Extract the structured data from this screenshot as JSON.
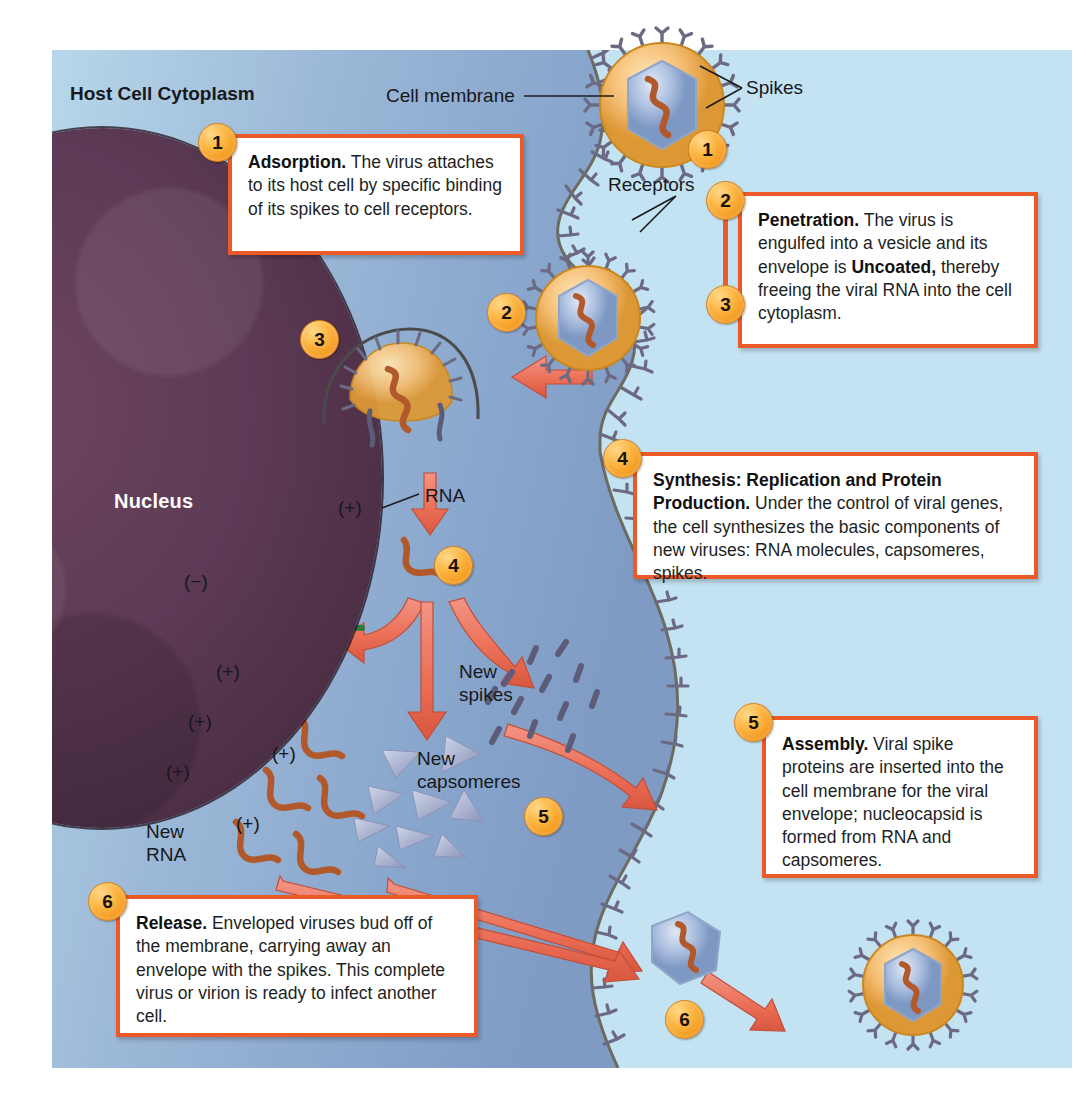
{
  "diagram": {
    "title_labels": {
      "cytoplasm": "Host Cell Cytoplasm",
      "nucleus": "Nucleus",
      "cell_membrane": "Cell membrane",
      "spikes": "Spikes",
      "receptors": "Receptors",
      "rna": "RNA",
      "new_spikes": "New\nspikes",
      "new_capsomeres": "New\ncapsomeres",
      "new_rna": "New\nRNA"
    },
    "polarity_markers": [
      {
        "id": "rna-plus-top",
        "text": "(+)"
      },
      {
        "id": "rna-minus",
        "text": "(−)"
      },
      {
        "id": "new-rna-plus-1",
        "text": "(+)"
      },
      {
        "id": "new-rna-plus-2",
        "text": "(+)"
      },
      {
        "id": "new-rna-plus-3",
        "text": "(+)"
      },
      {
        "id": "new-rna-plus-4",
        "text": "(+)"
      },
      {
        "id": "new-rna-plus-5",
        "text": "(+)"
      }
    ],
    "steps": [
      {
        "number": "1",
        "title": "Adsorption.",
        "body": " The virus attaches to its host cell by specific binding of its spikes to cell receptors."
      },
      {
        "number": "2",
        "title": "Penetration.",
        "body": " The virus is engulfed into a vesicle and its envelope is"
      },
      {
        "number": "3",
        "title": "Uncoated,",
        "body": " thereby freeing the viral RNA into the cell cytoplasm."
      },
      {
        "number": "4",
        "title": "Synthesis: Replication and Protein Production.",
        "body": " Under the control of viral genes, the cell synthesizes the basic components of new viruses: RNA molecules, capsomeres, spikes."
      },
      {
        "number": "5",
        "title": "Assembly.",
        "body": " Viral spike proteins are inserted into the cell membrane for the viral envelope; nucleocapsid is formed from RNA and capsomeres."
      },
      {
        "number": "6",
        "title": "Release.",
        "body": " Enveloped viruses bud off of the membrane, carrying away an envelope with the spikes. This complete virus or virion is ready to infect another cell."
      }
    ],
    "stage_markers": [
      {
        "id": "marker-1",
        "number": "1"
      },
      {
        "id": "marker-2",
        "number": "2"
      },
      {
        "id": "marker-3",
        "number": "3"
      },
      {
        "id": "marker-4",
        "number": "4"
      },
      {
        "id": "marker-5",
        "number": "5"
      },
      {
        "id": "marker-6",
        "number": "6"
      }
    ],
    "colors": {
      "cytoplasm": "#c3e2f2",
      "cytoplasm_shaded": "#7f9bc4",
      "nucleus": "#4b2e44",
      "callout_border": "#eb5b2a",
      "badge": "#fcb745",
      "arrow": "#ee7861",
      "rna_plus": "#b55a2e",
      "rna_minus": "#2f7b3f",
      "capsomere": "#9aa3c4",
      "spike": "#6b6a86",
      "envelope": "#f2b760"
    }
  }
}
